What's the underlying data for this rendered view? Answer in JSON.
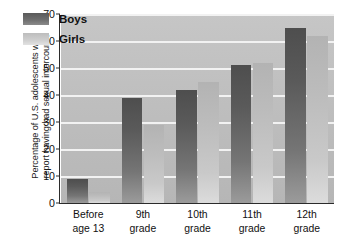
{
  "chart_data": {
    "type": "bar",
    "title": "",
    "xlabel": "",
    "ylabel_line1": "Percentage of U.S. adolescents who",
    "ylabel_line2": "report having had sexual intercourse",
    "categories": [
      {
        "line1": "Before",
        "line2": "age 13"
      },
      {
        "line1": "9th",
        "line2": "grade"
      },
      {
        "line1": "10th",
        "line2": "grade"
      },
      {
        "line1": "11th",
        "line2": "grade"
      },
      {
        "line1": "12th",
        "line2": "grade"
      }
    ],
    "series": [
      {
        "name": "Boys",
        "values": [
          9,
          39,
          42,
          51,
          65
        ],
        "color": "#5f5f5f"
      },
      {
        "name": "Girls",
        "values": [
          4,
          29,
          45,
          52,
          62
        ],
        "color": "#c6c6c6"
      }
    ],
    "ylim": [
      0,
      70
    ],
    "yticks": [
      0,
      10,
      20,
      30,
      40,
      50,
      60,
      70
    ],
    "ytick_labels": [
      "0",
      "10",
      "20",
      "30",
      "40",
      "50",
      "60",
      "70"
    ],
    "grid": "horizontal-white",
    "legend_position": "upper-left-inside",
    "plot_background": "#bfbfbf",
    "gridline_color": "#f2f2f2",
    "axis_color": "#2b2b2b"
  }
}
